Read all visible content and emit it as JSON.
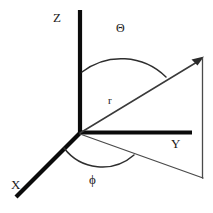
{
  "figure": {
    "background_color": "#ffffff",
    "line_color": "#0b0b0b",
    "thin_line_color": "#3a3a3a",
    "width": 213,
    "height": 213
  },
  "axes": {
    "z": {
      "label": "Z",
      "description": "vertical axis"
    },
    "y": {
      "label": "Y",
      "description": "horizontal axis to the right"
    },
    "x": {
      "label": "X",
      "description": "axis toward lower left"
    }
  },
  "vector": {
    "label": "r",
    "description": "radial vector with arrowhead"
  },
  "angles": {
    "polar": {
      "label": "Θ",
      "description": "polar angle from Z axis to r"
    },
    "azimuthal": {
      "label": "ϕ",
      "description": "azimuthal angle from X axis to projection of r"
    }
  },
  "projection": {
    "description": "projection of r onto the XY plane and vertical drop line"
  },
  "geometry": {
    "origin": {
      "x": 80,
      "y": 133
    },
    "z_top": {
      "x": 80,
      "y": 10
    },
    "y_end": {
      "x": 192,
      "y": 133
    },
    "x_end": {
      "x": 16,
      "y": 197
    },
    "r_tip": {
      "x": 203,
      "y": 58
    },
    "proj_end": {
      "x": 203,
      "y": 178
    }
  }
}
